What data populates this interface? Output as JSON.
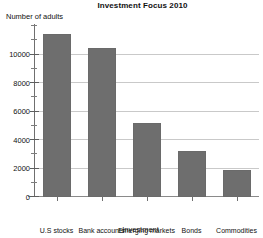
{
  "chart_data": {
    "type": "bar",
    "title": "Investment Focus 2010",
    "xlabel": "Investment",
    "ylabel": "Number of adults",
    "categories": [
      "U.S stocks",
      "Bank accounts",
      "Emerging markets",
      "Bonds",
      "Commodities"
    ],
    "values": [
      11450,
      10490,
      5200,
      3200,
      1900
    ],
    "ylim": [
      0,
      12000
    ],
    "yticks": [
      0,
      2000,
      4000,
      6000,
      8000,
      10000
    ],
    "ytick_labels": [
      "0",
      "2000",
      "4000",
      "6000",
      "8000",
      "10000"
    ],
    "minor_tick_step": 1000,
    "grid": true,
    "grid_axis": "y",
    "legend": false,
    "bar_color": "#6e6e6e",
    "grid_color": "#c9c9c9",
    "axis_color": "#6f6f6f",
    "background": "#ffffff"
  }
}
